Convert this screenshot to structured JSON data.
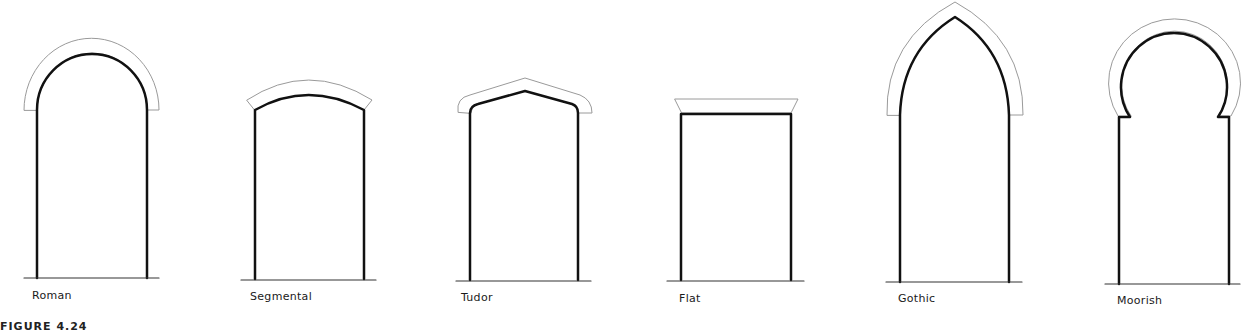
{
  "figure": {
    "caption": "FIGURE 4.24",
    "arches": [
      {
        "name": "Roman",
        "label": "Roman"
      },
      {
        "name": "Segmental",
        "label": "Segmental"
      },
      {
        "name": "Tudor",
        "label": "Tudor"
      },
      {
        "name": "Flat",
        "label": "Flat"
      },
      {
        "name": "Gothic",
        "label": "Gothic"
      },
      {
        "name": "Moorish",
        "label": "Moorish"
      }
    ],
    "colors": {
      "opening_stroke": "#111111",
      "voussoir_stroke": "#999999",
      "ground": "#333333"
    }
  }
}
